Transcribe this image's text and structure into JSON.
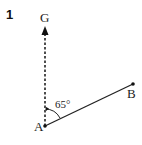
{
  "question_number": "1",
  "points": {
    "G": {
      "label": "G"
    },
    "A": {
      "label": "A"
    },
    "B": {
      "label": "B"
    }
  },
  "angle": {
    "label": "65°",
    "value": 65,
    "between": [
      "AG",
      "AB"
    ]
  },
  "lines": [
    {
      "from": "A",
      "to": "G",
      "style": "dashed",
      "arrow": true
    },
    {
      "from": "A",
      "to": "B",
      "style": "solid"
    }
  ]
}
